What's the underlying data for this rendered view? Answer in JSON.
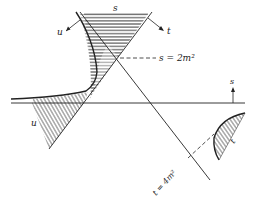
{
  "diagram": {
    "type": "mandelstam-plane",
    "colors": {
      "ink": "#222222",
      "background": "#ffffff",
      "hatch": "#444444"
    },
    "axes": {
      "s_direction_label": "s",
      "t_direction_label": "t",
      "u_direction_label": "u"
    },
    "regions": [
      {
        "id": "s-channel",
        "label": "s",
        "hatch": "horizontal"
      },
      {
        "id": "u-channel",
        "label": "u",
        "hatch": "diagonal"
      },
      {
        "id": "t-channel",
        "label": "t",
        "hatch": "diagonal"
      }
    ],
    "annotations": {
      "s_threshold": "s = 2m²",
      "t_threshold": "t = 4m²"
    }
  }
}
